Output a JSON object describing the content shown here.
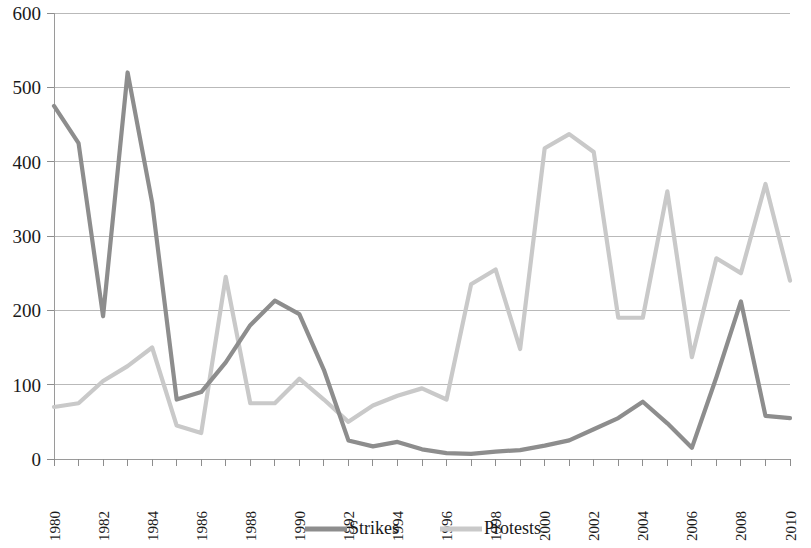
{
  "chart_data": {
    "type": "line",
    "title": "",
    "subtitle": "",
    "xlabel": "",
    "ylabel": "",
    "ylim": [
      0,
      600
    ],
    "ytick_values": [
      0,
      100,
      200,
      300,
      400,
      500,
      600
    ],
    "ytick_labels": [
      "0",
      "100",
      "200",
      "300",
      "400",
      "500",
      "600"
    ],
    "grid": true,
    "legend_position": "bottom",
    "x": [
      1980,
      1981,
      1982,
      1983,
      1984,
      1985,
      1986,
      1987,
      1988,
      1989,
      1990,
      1991,
      1992,
      1993,
      1994,
      1995,
      1996,
      1997,
      1998,
      1999,
      2000,
      2001,
      2002,
      2003,
      2004,
      2005,
      2006,
      2007,
      2008,
      2009,
      2010
    ],
    "xtick_labels": [
      "1980",
      "1982",
      "1984",
      "1986",
      "1988",
      "1990",
      "1992",
      "1994",
      "1996",
      "1998",
      "2000",
      "2002",
      "2004",
      "2006",
      "2008",
      "2010"
    ],
    "xtick_values": [
      1980,
      1982,
      1984,
      1986,
      1988,
      1990,
      1992,
      1994,
      1996,
      1998,
      2000,
      2002,
      2004,
      2006,
      2008,
      2010
    ],
    "series": [
      {
        "name": "Strikes",
        "color": "#8d8d8d",
        "values": [
          475,
          425,
          192,
          520,
          345,
          80,
          90,
          130,
          180,
          213,
          195,
          120,
          25,
          17,
          23,
          13,
          8,
          7,
          10,
          12,
          18,
          25,
          40,
          55,
          77,
          48,
          15,
          110,
          212,
          58,
          55
        ]
      },
      {
        "name": "Protests",
        "color": "#c9c9c9",
        "values": [
          70,
          75,
          105,
          125,
          150,
          45,
          35,
          245,
          75,
          75,
          108,
          80,
          50,
          72,
          85,
          95,
          80,
          235,
          255,
          148,
          418,
          437,
          413,
          190,
          190,
          360,
          137,
          270,
          250,
          370,
          240
        ]
      }
    ]
  },
  "legend": {
    "items": [
      {
        "label": "Strikes",
        "color": "#8d8d8d"
      },
      {
        "label": "Protests",
        "color": "#c9c9c9"
      }
    ]
  }
}
